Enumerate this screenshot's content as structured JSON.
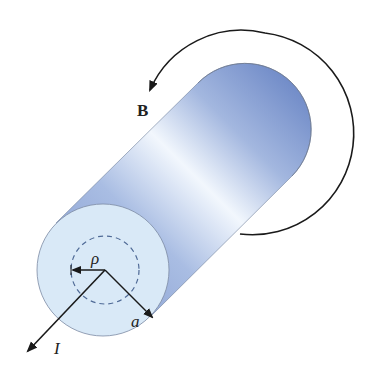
{
  "diagram": {
    "labels": {
      "magnetic_field": "B",
      "current": "I",
      "inner_radius": "ρ",
      "conductor_radius": "a"
    },
    "colors": {
      "cylinder_light": "#eaf2fb",
      "cylinder_mid": "#9fb4dc",
      "cylinder_dark": "#5f7cc0",
      "face_fill": "#d8e8f6",
      "arrow_stroke": "#1a1a1a",
      "dashed_circle": "#4f6a96"
    },
    "field_direction": "counterclockwise (viewed from front face)",
    "current_direction": "out of front face"
  }
}
